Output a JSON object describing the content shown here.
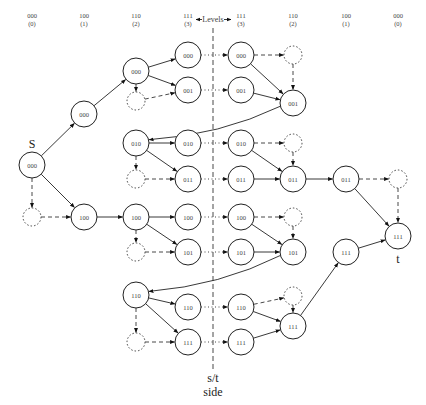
{
  "header": {
    "levels_label": "Levels",
    "columns": [
      {
        "x": 32,
        "bits": "000",
        "level": "(0)"
      },
      {
        "x": 84,
        "bits": "100",
        "level": "(1)"
      },
      {
        "x": 136,
        "bits": "110",
        "level": "(2)"
      },
      {
        "x": 188,
        "bits": "111",
        "level": "(3)"
      },
      {
        "x": 241,
        "bits": "111",
        "level": "(3)"
      },
      {
        "x": 293,
        "bits": "110",
        "level": "(2)"
      },
      {
        "x": 346,
        "bits": "100",
        "level": "(1)"
      },
      {
        "x": 398,
        "bits": "000",
        "level": "(0)"
      }
    ]
  },
  "divider": {
    "x": 213,
    "label_line1": "s/t",
    "label_line2": "side"
  },
  "labels": {
    "source": "S",
    "sink": "t"
  },
  "nodes": [
    {
      "id": "s",
      "x": 32,
      "y": 165,
      "label": "000",
      "type": "solid"
    },
    {
      "id": "s_d",
      "x": 32,
      "y": 217,
      "label": "",
      "type": "dotted"
    },
    {
      "id": "a0",
      "x": 84,
      "y": 114,
      "label": "000",
      "type": "solid"
    },
    {
      "id": "a1",
      "x": 84,
      "y": 217,
      "label": "100",
      "type": "solid"
    },
    {
      "id": "b0",
      "x": 136,
      "y": 71,
      "label": "000",
      "type": "solid"
    },
    {
      "id": "b0d",
      "x": 136,
      "y": 101,
      "label": "",
      "type": "dotted"
    },
    {
      "id": "c00",
      "x": 188,
      "y": 55,
      "label": "000",
      "type": "solid"
    },
    {
      "id": "c01",
      "x": 188,
      "y": 90,
      "label": "001",
      "type": "solid"
    },
    {
      "id": "e00",
      "x": 241,
      "y": 55,
      "label": "000",
      "type": "solid"
    },
    {
      "id": "e01",
      "x": 241,
      "y": 90,
      "label": "001",
      "type": "solid"
    },
    {
      "id": "f0d",
      "x": 293,
      "y": 55,
      "label": "",
      "type": "dotted"
    },
    {
      "id": "f0",
      "x": 293,
      "y": 103,
      "label": "001",
      "type": "solid"
    },
    {
      "id": "b1",
      "x": 136,
      "y": 143,
      "label": "010",
      "type": "solid"
    },
    {
      "id": "b1d",
      "x": 136,
      "y": 179,
      "label": "",
      "type": "dotted"
    },
    {
      "id": "c10",
      "x": 188,
      "y": 143,
      "label": "010",
      "type": "solid"
    },
    {
      "id": "c11",
      "x": 188,
      "y": 179,
      "label": "011",
      "type": "solid"
    },
    {
      "id": "e10",
      "x": 241,
      "y": 143,
      "label": "010",
      "type": "solid"
    },
    {
      "id": "e11",
      "x": 241,
      "y": 179,
      "label": "011",
      "type": "solid"
    },
    {
      "id": "f1d",
      "x": 293,
      "y": 143,
      "label": "",
      "type": "dotted"
    },
    {
      "id": "f1",
      "x": 293,
      "y": 179,
      "label": "011",
      "type": "solid"
    },
    {
      "id": "g1",
      "x": 346,
      "y": 179,
      "label": "011",
      "type": "solid"
    },
    {
      "id": "g1d",
      "x": 398,
      "y": 179,
      "label": "",
      "type": "dotted"
    },
    {
      "id": "b2",
      "x": 136,
      "y": 217,
      "label": "100",
      "type": "solid"
    },
    {
      "id": "b2d",
      "x": 136,
      "y": 252,
      "label": "",
      "type": "dotted"
    },
    {
      "id": "c20",
      "x": 188,
      "y": 217,
      "label": "100",
      "type": "solid"
    },
    {
      "id": "c21",
      "x": 188,
      "y": 252,
      "label": "101",
      "type": "solid"
    },
    {
      "id": "e20",
      "x": 241,
      "y": 217,
      "label": "100",
      "type": "solid"
    },
    {
      "id": "e21",
      "x": 241,
      "y": 252,
      "label": "101",
      "type": "solid"
    },
    {
      "id": "f2d",
      "x": 293,
      "y": 217,
      "label": "",
      "type": "dotted"
    },
    {
      "id": "f2",
      "x": 293,
      "y": 252,
      "label": "101",
      "type": "solid"
    },
    {
      "id": "b3",
      "x": 136,
      "y": 295,
      "label": "110",
      "type": "solid"
    },
    {
      "id": "b3d",
      "x": 136,
      "y": 342,
      "label": "",
      "type": "dotted"
    },
    {
      "id": "c30",
      "x": 188,
      "y": 307,
      "label": "110",
      "type": "solid"
    },
    {
      "id": "c31",
      "x": 188,
      "y": 342,
      "label": "111",
      "type": "solid"
    },
    {
      "id": "e30",
      "x": 241,
      "y": 307,
      "label": "110",
      "type": "solid"
    },
    {
      "id": "e31",
      "x": 241,
      "y": 342,
      "label": "111",
      "type": "solid"
    },
    {
      "id": "f3d",
      "x": 293,
      "y": 296,
      "label": "",
      "type": "dotted"
    },
    {
      "id": "f3",
      "x": 293,
      "y": 326,
      "label": "111",
      "type": "solid"
    },
    {
      "id": "g3",
      "x": 346,
      "y": 252,
      "label": "111",
      "type": "solid"
    },
    {
      "id": "t",
      "x": 398,
      "y": 236,
      "label": "111",
      "type": "solid"
    }
  ],
  "edges": [
    {
      "from": "s",
      "to": "a0",
      "style": "solid"
    },
    {
      "from": "s",
      "to": "a1",
      "style": "solid"
    },
    {
      "from": "s",
      "to": "s_d",
      "style": "dashed"
    },
    {
      "from": "s_d",
      "to": "a1",
      "style": "dashed"
    },
    {
      "from": "a0",
      "to": "b0",
      "style": "solid"
    },
    {
      "from": "a1",
      "to": "b2",
      "style": "solid"
    },
    {
      "from": "b0",
      "to": "c00",
      "style": "solid"
    },
    {
      "from": "b0",
      "to": "c01",
      "style": "solid"
    },
    {
      "from": "b0",
      "to": "b0d",
      "style": "dashed"
    },
    {
      "from": "b0d",
      "to": "c01",
      "style": "dashed"
    },
    {
      "from": "c00",
      "to": "e00",
      "style": "dotted"
    },
    {
      "from": "c01",
      "to": "e01",
      "style": "dotted"
    },
    {
      "from": "e00",
      "to": "f0d",
      "style": "dashed"
    },
    {
      "from": "e00",
      "to": "f0",
      "style": "solid"
    },
    {
      "from": "e01",
      "to": "f0",
      "style": "solid"
    },
    {
      "from": "f0d",
      "to": "f0",
      "style": "dashed"
    },
    {
      "from": "f0",
      "to": "b1",
      "style": "solid",
      "curve": true
    },
    {
      "from": "b1",
      "to": "c10",
      "style": "solid"
    },
    {
      "from": "b1",
      "to": "c11",
      "style": "solid"
    },
    {
      "from": "b1",
      "to": "b1d",
      "style": "dashed"
    },
    {
      "from": "b1d",
      "to": "c11",
      "style": "dashed"
    },
    {
      "from": "c10",
      "to": "e10",
      "style": "dotted"
    },
    {
      "from": "c11",
      "to": "e11",
      "style": "dotted"
    },
    {
      "from": "e10",
      "to": "f1d",
      "style": "dashed"
    },
    {
      "from": "e10",
      "to": "f1",
      "style": "solid"
    },
    {
      "from": "e11",
      "to": "f1",
      "style": "solid"
    },
    {
      "from": "f1d",
      "to": "f1",
      "style": "dashed"
    },
    {
      "from": "f1",
      "to": "g1",
      "style": "solid"
    },
    {
      "from": "g1",
      "to": "g1d",
      "style": "dashed"
    },
    {
      "from": "g1",
      "to": "t",
      "style": "solid"
    },
    {
      "from": "g1d",
      "to": "t",
      "style": "dashed"
    },
    {
      "from": "b2",
      "to": "c20",
      "style": "solid"
    },
    {
      "from": "b2",
      "to": "c21",
      "style": "solid"
    },
    {
      "from": "b2",
      "to": "b2d",
      "style": "dashed"
    },
    {
      "from": "b2d",
      "to": "c21",
      "style": "dashed"
    },
    {
      "from": "c20",
      "to": "e20",
      "style": "dotted"
    },
    {
      "from": "c21",
      "to": "e21",
      "style": "dotted"
    },
    {
      "from": "e20",
      "to": "f2d",
      "style": "dashed"
    },
    {
      "from": "e20",
      "to": "f2",
      "style": "solid"
    },
    {
      "from": "e21",
      "to": "f2",
      "style": "solid"
    },
    {
      "from": "f2d",
      "to": "f2",
      "style": "dashed"
    },
    {
      "from": "f2",
      "to": "b3",
      "style": "solid",
      "curve": true
    },
    {
      "from": "b3",
      "to": "c30",
      "style": "solid"
    },
    {
      "from": "b3",
      "to": "c31",
      "style": "solid"
    },
    {
      "from": "b3",
      "to": "b3d",
      "style": "dashed"
    },
    {
      "from": "b3d",
      "to": "c31",
      "style": "dashed"
    },
    {
      "from": "c30",
      "to": "e30",
      "style": "dotted"
    },
    {
      "from": "c31",
      "to": "e31",
      "style": "dotted"
    },
    {
      "from": "e30",
      "to": "f3d",
      "style": "dashed"
    },
    {
      "from": "e30",
      "to": "f3",
      "style": "solid"
    },
    {
      "from": "e31",
      "to": "f3",
      "style": "solid"
    },
    {
      "from": "f3d",
      "to": "f3",
      "style": "dashed"
    },
    {
      "from": "f3",
      "to": "g3",
      "style": "solid"
    },
    {
      "from": "g3",
      "to": "t",
      "style": "solid"
    }
  ]
}
